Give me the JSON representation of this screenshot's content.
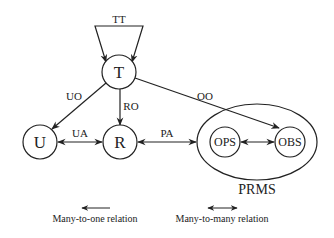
{
  "nodes": {
    "T": {
      "label": "T"
    },
    "U": {
      "label": "U"
    },
    "R": {
      "label": "R"
    },
    "OPS": {
      "label": "OPS"
    },
    "OBS": {
      "label": "OBS"
    }
  },
  "group": {
    "label": "PRMS"
  },
  "edges": {
    "TT": {
      "label": "TT"
    },
    "UO": {
      "label": "UO"
    },
    "RO": {
      "label": "RO"
    },
    "OO": {
      "label": "OO"
    },
    "UA": {
      "label": "UA"
    },
    "PA": {
      "label": "PA"
    }
  },
  "legend": {
    "many_to_one": "Many-to-one relation",
    "many_to_many": "Many-to-many relation"
  },
  "colors": {
    "stroke": "#222222",
    "background": "#ffffff"
  }
}
